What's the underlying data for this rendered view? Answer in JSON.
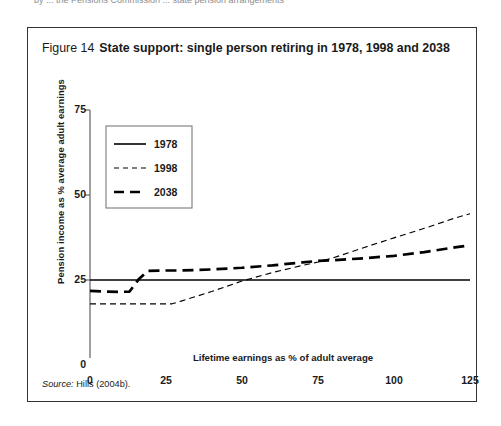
{
  "top_sliver_text": "by ... the Pensions Commission ... state pension arrangements",
  "figure": {
    "number": "Figure 14",
    "title": "State support: single person retiring in 1978, 1998 and 2038",
    "source_label": "Source:",
    "source_text": "Hills (2004b)."
  },
  "chart_data": {
    "type": "line",
    "title": "State support: single person retiring in 1978, 1998 and 2038",
    "xlabel": "Lifetime earnings as % of adult average",
    "ylabel": "Pension income as % average adult earnings",
    "xlim": [
      0,
      125
    ],
    "ylim": [
      0,
      75
    ],
    "xticks": [
      0,
      25,
      50,
      75,
      100,
      125
    ],
    "yticks": [
      0,
      25,
      50,
      75
    ],
    "grid": false,
    "legend_position": "upper-left-inside",
    "series": [
      {
        "name": "1978",
        "style": "solid",
        "x": [
          0,
          25,
          50,
          75,
          100,
          125
        ],
        "values": [
          25,
          25,
          25,
          25,
          25,
          25
        ]
      },
      {
        "name": "1998",
        "style": "dotted-dashed-fine",
        "x": [
          0,
          5,
          10,
          15,
          20,
          25,
          27,
          30,
          40,
          50,
          60,
          70,
          75,
          80,
          90,
          100,
          110,
          120,
          125
        ],
        "values": [
          18,
          18,
          18,
          18,
          18,
          18,
          18,
          18.8,
          21.6,
          24.7,
          27.2,
          29.3,
          30.3,
          31.5,
          34.5,
          37.4,
          40.2,
          43.2,
          44.5
        ]
      },
      {
        "name": "2038",
        "style": "dashed-thick",
        "x": [
          0,
          5,
          10,
          13,
          16,
          19,
          25,
          30,
          40,
          50,
          60,
          70,
          75,
          80,
          90,
          100,
          110,
          120,
          125
        ],
        "values": [
          21.8,
          21.6,
          21.5,
          21.6,
          25.2,
          27.7,
          27.8,
          27.8,
          28.1,
          28.6,
          29.3,
          30.2,
          30.6,
          30.8,
          31.4,
          32.1,
          33.2,
          34.6,
          35.2
        ]
      }
    ],
    "annotations": []
  },
  "legend": {
    "entries": [
      {
        "label": "1978"
      },
      {
        "label": "1998"
      },
      {
        "label": "2038"
      }
    ]
  },
  "colors": {
    "line": "#000000",
    "axis": "#6e6e6e",
    "frame": "#333333",
    "text": "#1a1a1a",
    "background": "#ffffff"
  }
}
